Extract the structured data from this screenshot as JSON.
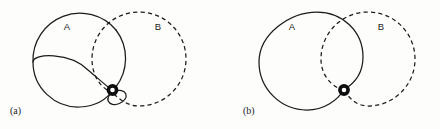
{
  "figure": {
    "background": "#fdfdfc",
    "stroke_color": "#1c1c1c",
    "node_color": "#0d0d0d",
    "width": 440,
    "height": 129
  },
  "panels": [
    {
      "id": "a",
      "caption": "(a)",
      "caption_x": 10,
      "caption_y": 112,
      "sets": [
        {
          "label": "A",
          "style": "solid",
          "cx": 80,
          "cy": 59,
          "r": 47,
          "label_x": 67,
          "label_y": 27
        },
        {
          "label": "B",
          "style": "dashed",
          "cx": 139,
          "cy": 59,
          "r": 47,
          "label_x": 158,
          "label_y": 27
        }
      ],
      "node": {
        "name": "tangency-node",
        "cx": 112,
        "cy": 91,
        "r": 4.2
      },
      "extra_loop": {
        "name": "small-loop",
        "cx": 116,
        "cy": 98,
        "rx": 9,
        "ry": 6.5,
        "rotation": -20,
        "style": "solid"
      }
    },
    {
      "id": "b",
      "caption": "(b)",
      "caption_x": 243,
      "caption_y": 112,
      "sets": [
        {
          "label": "A",
          "style": "solid",
          "cx": 305,
          "cy": 62,
          "r": 48,
          "label_x": 292,
          "label_y": 27
        },
        {
          "label": "B",
          "style": "dashed",
          "cx": 356,
          "cy": 62,
          "r": 48,
          "label_x": 381,
          "label_y": 27
        }
      ],
      "node": {
        "name": "tangency-node",
        "cx": 344,
        "cy": 90,
        "r": 4.2
      }
    }
  ]
}
